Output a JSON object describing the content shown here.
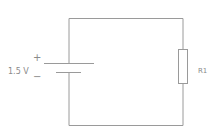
{
  "diagram": {
    "type": "circuit-schematic",
    "source": {
      "kind": "battery",
      "voltage_label": "1.5 V",
      "positive_sign": "+",
      "negative_sign": "−"
    },
    "load": {
      "kind": "resistor",
      "label": "R1"
    },
    "colors": {
      "wire": "#9a9a9a",
      "text": "#8a8a8a",
      "background": "#ffffff"
    }
  }
}
